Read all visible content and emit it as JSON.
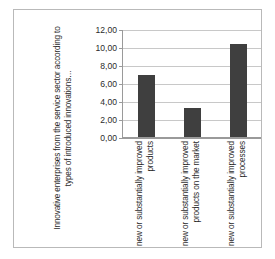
{
  "chart_data": {
    "type": "bar",
    "title": "",
    "subtitle": "",
    "xlabel": "",
    "ylabel": "Innovative enterprises from the service sector according to types of introduced innovations…",
    "categories": [
      "new or substantially improved products",
      "new or substantially improved products on the market",
      "new or substantially improved processes"
    ],
    "values": [
      6.9,
      3.2,
      10.3
    ],
    "ylim": [
      0,
      12
    ],
    "ytick_labels": [
      "0,00",
      "2,00",
      "4,00",
      "6,00",
      "8,00",
      "10,00",
      "12,00"
    ],
    "ytick_values": [
      0,
      2,
      4,
      6,
      8,
      10,
      12
    ],
    "grid": true,
    "legend": false,
    "legend_position": "none",
    "series": [
      {
        "name": "",
        "values": [
          6.9,
          3.2,
          10.3
        ],
        "color": "#3f3f3f"
      }
    ],
    "bar_color": "#3f3f3f",
    "axis_color": "#9a9a9a",
    "gridline_color": "#c8c8c8",
    "border_color": "#b9b9b9"
  }
}
